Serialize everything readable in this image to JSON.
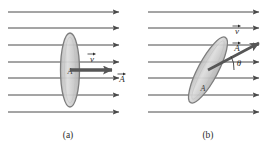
{
  "figure": {
    "background_color": "#ffffff",
    "line_color": "#4a4a4a",
    "ellipse_fill": "#cfcfcf",
    "ellipse_stroke": "#7d7d7d",
    "vector_color": "#555555",
    "text_color": "#2b2b2b"
  },
  "panels": [
    {
      "id": "a",
      "caption": "(a)",
      "field_lines": {
        "count": 7,
        "direction": "right",
        "y_positions": [
          12,
          28,
          45,
          62,
          78,
          95,
          112
        ],
        "x_start": 8,
        "x_end": 122
      },
      "surface": {
        "shape": "ellipse",
        "orientation": "perpendicular-to-field",
        "area_label": "A",
        "center_x": 70,
        "center_y": 70,
        "rx": 9,
        "ry": 37,
        "tilt_deg": 0
      },
      "vectors": [
        {
          "name": "velocity",
          "label": "v",
          "arrow_over": true,
          "angle_deg": 0
        },
        {
          "name": "area-normal",
          "label": "A",
          "arrow_over": true,
          "angle_deg": 0
        }
      ],
      "angle": null
    },
    {
      "id": "b",
      "caption": "(b)",
      "field_lines": {
        "count": 7,
        "direction": "right",
        "y_positions": [
          12,
          28,
          45,
          62,
          78,
          95,
          112
        ],
        "x_start": 148,
        "x_end": 262
      },
      "surface": {
        "shape": "ellipse",
        "orientation": "tilted-to-field",
        "area_label": "A",
        "center_x": 208,
        "center_y": 70,
        "rx": 10,
        "ry": 37,
        "tilt_deg": 28
      },
      "vectors": [
        {
          "name": "velocity",
          "label": "v",
          "arrow_over": true,
          "angle_deg": 0
        },
        {
          "name": "area-normal",
          "label": "A",
          "arrow_over": true,
          "angle_deg": -28
        }
      ],
      "angle": {
        "label": "θ",
        "value_deg": 28
      }
    }
  ]
}
